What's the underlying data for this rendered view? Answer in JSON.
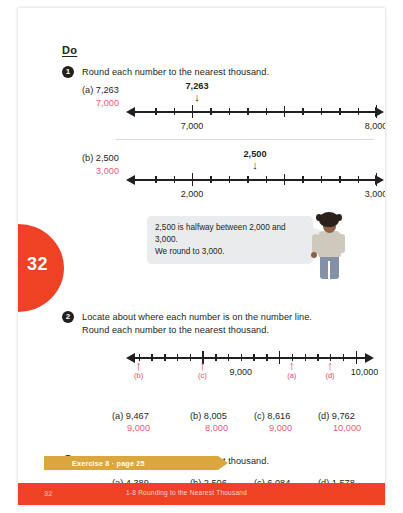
{
  "page": {
    "tab_number": "32",
    "footer_page_number": "32",
    "footer_title": "1-8  Rounding to the Nearest Thousand",
    "exercise_banner": "Exercise 8 · page 25",
    "accent_red": "#ef4123",
    "answer_pink": "#ef5a7a",
    "banner_gold": "#dba73c"
  },
  "heading": {
    "do": "Do"
  },
  "task1": {
    "number": "1",
    "instruction": "Round each number to the nearest thousand.",
    "parts": [
      {
        "label": "(a)  7,263",
        "answer": "7,000",
        "pointer_value": "7,263",
        "pointer_arrow": "↓",
        "pointer_pos_pct": 26,
        "left_tick_label": "7,000",
        "right_tick_label": "8,000"
      },
      {
        "label": "(b)  2,500",
        "answer": "3,000",
        "pointer_value": "2,500",
        "pointer_arrow": "↓",
        "pointer_pos_pct": 50,
        "left_tick_label": "2,000",
        "right_tick_label": "3,000"
      }
    ]
  },
  "speech_bubble": {
    "line1": "2,500 is halfway between 2,000 and 3,000.",
    "line2": "We round to 3,000."
  },
  "task2": {
    "number": "2",
    "instruction_line1": "Locate about where each number is on the number line.",
    "instruction_line2": "Round each number to the nearest thousand.",
    "numberline": {
      "left_label": "9,000",
      "right_label": "10,000",
      "left_label_pos_pct": 40,
      "right_label_pos_pct": 90,
      "markers": [
        {
          "label": "(b)",
          "pos_pct": 1
        },
        {
          "label": "(c)",
          "pos_pct": 30
        },
        {
          "label": "(a)",
          "pos_pct": 63
        },
        {
          "label": "(d)",
          "pos_pct": 80
        }
      ]
    },
    "answers": [
      {
        "question": "(a)  9,467",
        "answer": "9,000"
      },
      {
        "question": "(b)  8,005",
        "answer": "8,000"
      },
      {
        "question": "(c)  8,616",
        "answer": "9,000"
      },
      {
        "question": "(d)  9,762",
        "answer": "10,000"
      }
    ]
  },
  "task3": {
    "number": "3",
    "instruction": "Round each number to the nearest thousand.",
    "answers": [
      {
        "question": "(a)  4,389",
        "answer": "4,000"
      },
      {
        "question": "(b)  2,506",
        "answer": "3,000"
      },
      {
        "question": "(c)  6,084",
        "answer": "6,000"
      },
      {
        "question": "(d)  1,578",
        "answer": "2,000"
      }
    ]
  }
}
